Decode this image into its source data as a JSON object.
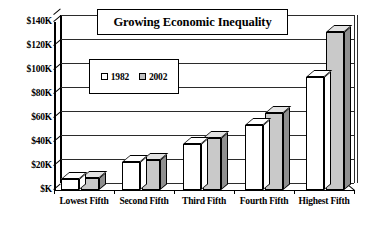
{
  "chart_data": {
    "type": "bar",
    "title": "Growing Economic Inequality",
    "xlabel": "",
    "ylabel": "",
    "categories": [
      "Lowest Fifth",
      "Second Fifth",
      "Third Fifth",
      "Fourth Fifth",
      "Highest Fifth"
    ],
    "series": [
      {
        "name": "1982",
        "values": [
          9,
          23,
          38,
          54,
          94
        ],
        "color": "#ffffff"
      },
      {
        "name": "2002",
        "values": [
          10,
          25,
          43,
          64,
          132
        ],
        "color": "#c9c9c9"
      }
    ],
    "ylim": [
      0,
      140
    ],
    "ytick_values": [
      140,
      120,
      100,
      80,
      60,
      40,
      20,
      0
    ],
    "ytick_labels": [
      "$140K",
      "$120K",
      "$100K",
      "$80K",
      "$60K",
      "$40K",
      "$20K",
      "$K"
    ],
    "grid": true,
    "legend_position": "inside-upper-left",
    "style": "3d-column",
    "units": "thousands of dollars"
  },
  "legend": {
    "entries": [
      {
        "label": "1982",
        "swatch": "hollow-white-square"
      },
      {
        "label": "2002",
        "swatch": "filled-gray-square"
      }
    ]
  }
}
